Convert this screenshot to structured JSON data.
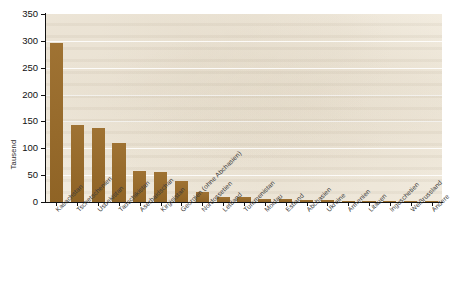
{
  "chart_data": {
    "type": "bar",
    "title": "",
    "xlabel": "",
    "ylabel": "Tausend",
    "ylim": [
      0,
      350
    ],
    "ytick_step": 50,
    "yticks": [
      "0",
      "50",
      "100",
      "150",
      "200",
      "250",
      "300",
      "350"
    ],
    "grid": true,
    "legend": "none",
    "bar_color": "#9a6b28",
    "plot_background": "#f4eee2",
    "categories": [
      "Kasachstan",
      "Tschetschenien",
      "Usbekistan",
      "Tadschikistan",
      "Aserbaidschan",
      "Kirgisistan",
      "Georgien (ohne Abchasien)",
      "Nordossetien",
      "Lettland",
      "Turkmenistan",
      "Moldau",
      "Estland",
      "Abchasien",
      "Ukraine",
      "Armenien",
      "Litauen",
      "Inguschetien",
      "Weißrussland",
      "Andere"
    ],
    "values": [
      296,
      144,
      137,
      110,
      57,
      56,
      40,
      18,
      10,
      9,
      6,
      5,
      3.5,
      3,
      2,
      1.5,
      1,
      1,
      1
    ]
  },
  "caption": {
    "text": ""
  }
}
